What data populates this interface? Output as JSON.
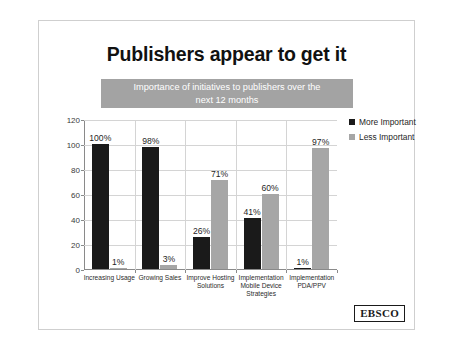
{
  "slide": {
    "title": "Publishers appear to get it",
    "subtitle": "Importance of initiatives to publishers over the next 12 months",
    "subtitle_line1": "Importance of initiatives to publishers over the",
    "subtitle_line2": "next 12 months",
    "logo_text": "EBSCO",
    "colors": {
      "more_important": "#1a1a1a",
      "less_important": "#a6a6a6",
      "banner": "#a3a3a3",
      "gridline": "#d4d4d4",
      "slide_border": "#cfcfcf"
    }
  },
  "chart_data": {
    "type": "bar",
    "title": "Importance of initiatives to publishers over the next 12 months",
    "xlabel": "",
    "ylabel": "",
    "ylim": [
      0,
      120
    ],
    "yticks": [
      0,
      20,
      40,
      60,
      80,
      100,
      120
    ],
    "ytick_labels": [
      "0",
      "20",
      "40",
      "60",
      "80",
      "100",
      "120"
    ],
    "grid": true,
    "legend_position": "right",
    "categories": [
      "Increasing Usage",
      "Growing Sales",
      "Improve Hosting Solutions",
      "Implementation Mobile Device Strategies",
      "Implementation PDA/PPV"
    ],
    "series": [
      {
        "name": "More Important",
        "color": "#1a1a1a",
        "values": [
          100,
          98,
          26,
          41,
          1
        ],
        "labels": [
          "100%",
          "98%",
          "26%",
          "41%",
          "1%"
        ]
      },
      {
        "name": "Less Important",
        "color": "#a6a6a6",
        "values": [
          1,
          3,
          71,
          60,
          97
        ],
        "labels": [
          "1%",
          "3%",
          "71%",
          "60%",
          "97%"
        ]
      }
    ]
  }
}
